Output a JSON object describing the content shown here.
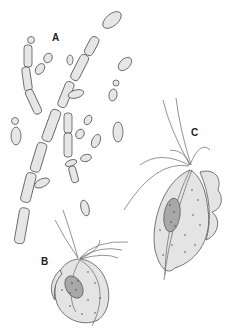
{
  "figure": {
    "labels": {
      "a": "A",
      "b": "B",
      "c": "C"
    },
    "panels": [
      {
        "id": "A",
        "subject": "pseudohyphae with budding yeast cells"
      },
      {
        "id": "B",
        "subject": "flagellated protozoan (rounded form)"
      },
      {
        "id": "C",
        "subject": "flagellated protozoan with undulating membrane"
      }
    ],
    "colors": {
      "fill": "#e6e6e6",
      "outline": "#555555",
      "nucleus": "#a8a8a8"
    }
  }
}
